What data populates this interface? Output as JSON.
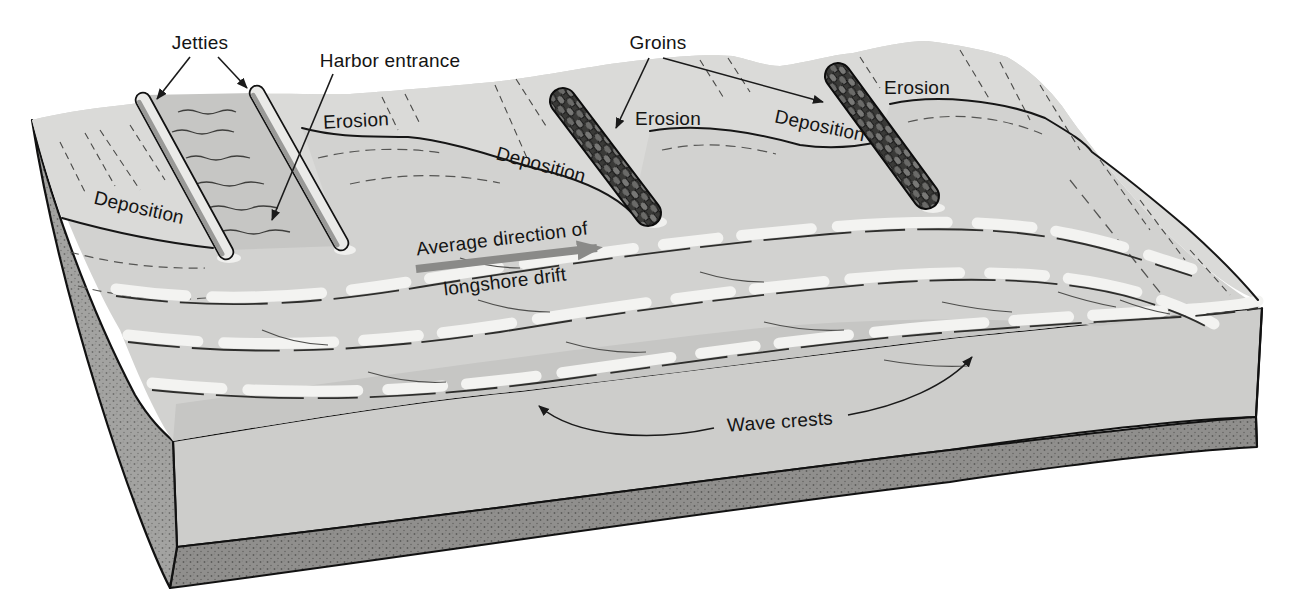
{
  "figure": {
    "type": "block-diagram",
    "topic": "Effect of jetties and groins on shoreline erosion and deposition",
    "labels": {
      "jetties": "Jetties",
      "harbor_entrance": "Harbor entrance",
      "erosion_near_harbor": "Erosion",
      "deposition_left_shore": "Deposition",
      "deposition_updrift_groin1": "Deposition",
      "groins": "Groins",
      "erosion_downdrift_groin1": "Erosion",
      "deposition_updrift_groin2": "Deposition",
      "erosion_downdrift_groin2": "Erosion",
      "drift_arrow_line1": "Average direction of",
      "drift_arrow_line2": "longshore drift",
      "wave_crests": "Wave crests"
    },
    "colors": {
      "paper": "#ffffff",
      "land": "#dadad8",
      "sea": "#d2d2d0",
      "sea_foreground": "#c6c6c4",
      "wave_highlight": "#f3f3f1",
      "channel_water": "#c6c6c4",
      "jetty_top": "#eaeae8",
      "jetty_side": "#9a9a98",
      "groin_rock": "#3a3a38",
      "block_left_face": "#a3a3a1",
      "block_front_face": "#cdcdcb",
      "block_base_strip": "#908f8d",
      "drift_arrow": "#8a8a88",
      "ink": "#161616"
    }
  }
}
